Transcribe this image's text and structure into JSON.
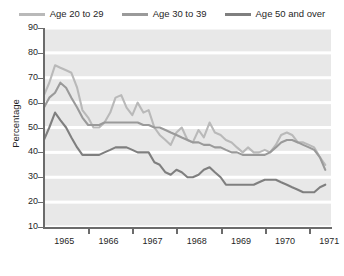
{
  "chart_data": {
    "type": "line",
    "title": "",
    "xlabel": "",
    "ylabel": "Percentage",
    "ylim": [
      10,
      90
    ],
    "ytick_values": [
      90,
      80,
      70,
      60,
      50,
      40,
      30,
      20,
      10
    ],
    "ytick_labels": [
      "90",
      "80",
      "70",
      "60",
      "50",
      "40",
      "30",
      "20",
      "10"
    ],
    "xtick_labels": [
      "1965",
      "1966",
      "1967",
      "1968",
      "1969",
      "1970",
      "1971"
    ],
    "x_range": [
      1965.0,
      1971.5
    ],
    "grid": "horizontal-white-bands",
    "legend_position": "top-center",
    "plot_background": "#e8e8e8",
    "series": [
      {
        "name": "Age 20 to 29",
        "color": "#b9b9b9",
        "x": [
          1965.0,
          1965.12,
          1965.25,
          1965.37,
          1965.5,
          1965.62,
          1965.75,
          1965.87,
          1966.0,
          1966.12,
          1966.25,
          1966.37,
          1966.5,
          1966.62,
          1966.75,
          1966.87,
          1967.0,
          1967.12,
          1967.25,
          1967.37,
          1967.5,
          1967.62,
          1967.75,
          1967.87,
          1968.0,
          1968.12,
          1968.25,
          1968.37,
          1968.5,
          1968.62,
          1968.75,
          1968.87,
          1969.0,
          1969.12,
          1969.25,
          1969.37,
          1969.5,
          1969.62,
          1969.75,
          1969.87,
          1970.0,
          1970.12,
          1970.25,
          1970.37,
          1970.5,
          1970.62,
          1970.75,
          1970.87,
          1971.0,
          1971.12,
          1971.25,
          1971.37
        ],
        "values": [
          63,
          68,
          75,
          74,
          73,
          72,
          66,
          57,
          54,
          50,
          50,
          52,
          56,
          62,
          63,
          58,
          55,
          60,
          56,
          57,
          50,
          47,
          45,
          43,
          48,
          50,
          45,
          44,
          49,
          46,
          52,
          48,
          47,
          45,
          44,
          42,
          40,
          42,
          40,
          40,
          41,
          40,
          43,
          47,
          48,
          47,
          44,
          44,
          43,
          42,
          38,
          35
        ]
      },
      {
        "name": "Age 30 to 39",
        "color": "#9a9a9a",
        "x": [
          1965.0,
          1965.12,
          1965.25,
          1965.37,
          1965.5,
          1965.62,
          1965.75,
          1965.87,
          1966.0,
          1966.12,
          1966.25,
          1966.37,
          1966.5,
          1966.62,
          1966.75,
          1966.87,
          1967.0,
          1967.12,
          1967.25,
          1967.37,
          1967.5,
          1967.62,
          1967.75,
          1967.87,
          1968.0,
          1968.12,
          1968.25,
          1968.37,
          1968.5,
          1968.62,
          1968.75,
          1968.87,
          1969.0,
          1969.12,
          1969.25,
          1969.37,
          1969.5,
          1969.62,
          1969.75,
          1969.87,
          1970.0,
          1970.12,
          1970.25,
          1970.37,
          1970.5,
          1970.62,
          1970.75,
          1970.87,
          1971.0,
          1971.12,
          1971.25,
          1971.37
        ],
        "values": [
          58,
          62,
          64,
          68,
          66,
          62,
          58,
          54,
          51,
          51,
          51,
          52,
          52,
          52,
          52,
          52,
          52,
          52,
          51,
          51,
          50,
          50,
          49,
          48,
          47,
          46,
          45,
          44,
          44,
          43,
          43,
          42,
          42,
          41,
          40,
          40,
          39,
          39,
          39,
          39,
          39,
          40,
          42,
          44,
          45,
          45,
          44,
          43,
          42,
          41,
          38,
          33
        ]
      },
      {
        "name": "Age 50 and over",
        "color": "#7f7f7f",
        "x": [
          1965.0,
          1965.12,
          1965.25,
          1965.37,
          1965.5,
          1965.62,
          1965.75,
          1965.87,
          1966.0,
          1966.12,
          1966.25,
          1966.37,
          1966.5,
          1966.62,
          1966.75,
          1966.87,
          1967.0,
          1967.12,
          1967.25,
          1967.37,
          1967.5,
          1967.62,
          1967.75,
          1967.87,
          1968.0,
          1968.12,
          1968.25,
          1968.37,
          1968.5,
          1968.62,
          1968.75,
          1968.87,
          1969.0,
          1969.12,
          1969.25,
          1969.37,
          1969.5,
          1969.62,
          1969.75,
          1969.87,
          1970.0,
          1970.12,
          1970.25,
          1970.37,
          1970.5,
          1970.62,
          1970.75,
          1970.87,
          1971.0,
          1971.12,
          1971.25,
          1971.37
        ],
        "values": [
          45,
          50,
          56,
          53,
          50,
          46,
          42,
          39,
          39,
          39,
          39,
          40,
          41,
          42,
          42,
          42,
          41,
          40,
          40,
          40,
          36,
          35,
          32,
          31,
          33,
          32,
          30,
          30,
          31,
          33,
          34,
          32,
          30,
          27,
          27,
          27,
          27,
          27,
          27,
          28,
          29,
          29,
          29,
          28,
          27,
          26,
          25,
          24,
          24,
          24,
          26,
          27
        ]
      }
    ]
  }
}
